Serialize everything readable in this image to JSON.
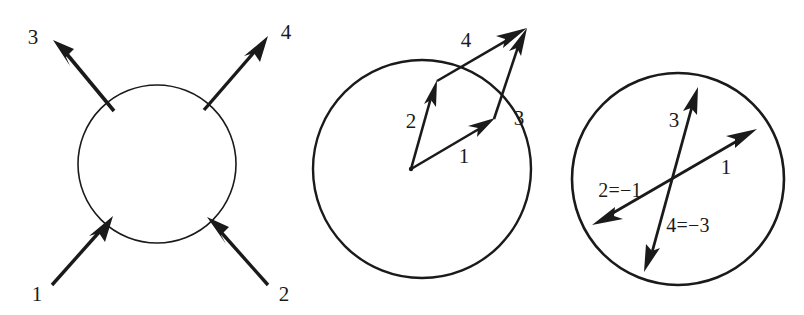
{
  "figure": {
    "background_color": "#ffffff",
    "ink_color": "#1a1a1a",
    "width": 804,
    "height": 315
  },
  "panels": [
    {
      "id": "panel-left",
      "name": "four-external-legs",
      "circle": {
        "cx": 157,
        "cy": 164,
        "r": 79,
        "stroke_width": 1.6
      },
      "arrows": [
        {
          "label": "3",
          "direction": "outgoing",
          "from": [
            113,
            112
          ],
          "to": [
            55,
            42
          ],
          "label_pos": [
            33,
            38
          ]
        },
        {
          "label": "4",
          "direction": "outgoing",
          "from": [
            205,
            110
          ],
          "to": [
            266,
            38
          ],
          "label_pos": [
            286,
            33
          ]
        },
        {
          "label": "1",
          "direction": "incoming",
          "from": [
            52,
            285
          ],
          "to": [
            110,
            219
          ],
          "label_pos": [
            37,
            295
          ]
        },
        {
          "label": "2",
          "direction": "incoming",
          "from": [
            268,
            285
          ],
          "to": [
            210,
            220
          ],
          "label_pos": [
            284,
            295
          ]
        }
      ]
    },
    {
      "id": "panel-middle",
      "name": "vectors-from-center",
      "circle": {
        "cx": 422,
        "cy": 169,
        "r": 109,
        "stroke_width": 2.4
      },
      "origin": [
        411,
        169
      ],
      "apex": [
        526,
        28
      ],
      "arrows": [
        {
          "label": "1",
          "from": [
            411,
            169
          ],
          "to": [
            494,
            119
          ],
          "label_pos": [
            464,
            157
          ]
        },
        {
          "label": "2",
          "from": [
            411,
            169
          ],
          "to": [
            437,
            81
          ],
          "label_pos": [
            411,
            122
          ]
        },
        {
          "label": "3",
          "from": [
            494,
            119
          ],
          "to": [
            526,
            28
          ],
          "label_pos": [
            518,
            119
          ]
        },
        {
          "label": "4",
          "from": [
            437,
            81
          ],
          "to": [
            526,
            28
          ],
          "label_pos": [
            466,
            41
          ]
        }
      ]
    },
    {
      "id": "panel-right",
      "name": "crossed-chords-identifications",
      "circle": {
        "cx": 678,
        "cy": 179,
        "r": 106,
        "stroke_width": 2.6
      },
      "arrows": [
        {
          "label": "1",
          "from": [
            594,
            224
          ],
          "to": [
            756,
            130
          ],
          "label_pos": [
            725,
            168
          ]
        },
        {
          "label": "2=−1",
          "from": [
            756,
            130
          ],
          "to": [
            594,
            224
          ],
          "label_pos": [
            619,
            191
          ]
        },
        {
          "label": "3",
          "from": [
            644,
            270
          ],
          "to": [
            698,
            88
          ],
          "label_pos": [
            674,
            121
          ]
        },
        {
          "label": "4=−3",
          "from": [
            698,
            88
          ],
          "to": [
            644,
            270
          ],
          "label_pos": [
            687,
            226
          ]
        }
      ]
    }
  ],
  "labels": {
    "panel_left": [
      "3",
      "4",
      "1",
      "2"
    ],
    "panel_middle": [
      "4",
      "2",
      "1",
      "3"
    ],
    "panel_right": [
      "3",
      "1",
      "2=−1",
      "4=−3"
    ]
  }
}
